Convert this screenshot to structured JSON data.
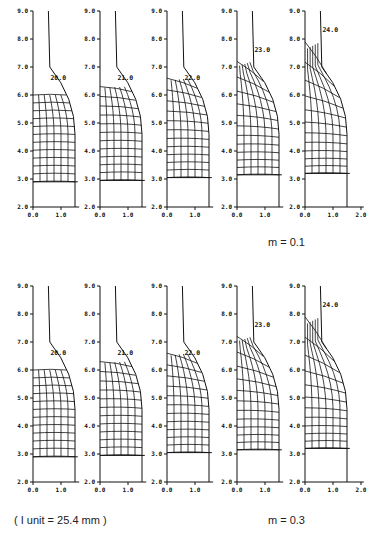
{
  "figure": {
    "captions": {
      "row1_param": "m = 0.1",
      "row2_param": "m = 0.3",
      "unit_note": "( I unit = 25.4 mm )"
    }
  },
  "chart_data": [
    {
      "type": "line",
      "title": "Deformed mesh evolution, m = 0.1",
      "xlabel": "",
      "ylabel": "",
      "xlim": [
        0.0,
        2.0
      ],
      "ylim": [
        2.0,
        9.0
      ],
      "y_ticks": [
        "2.0",
        "3.0",
        "4.0",
        "5.0",
        "6.0",
        "7.0",
        "8.0",
        "9.0"
      ],
      "x_ticks_panels_1_4": [
        "0.0",
        "1.0"
      ],
      "x_ticks_panel_5": [
        "0.0",
        "1.0",
        "2.0"
      ],
      "panels": [
        {
          "stage_label": "20.0",
          "mesh_top": 6.0,
          "mesh_bottom": 2.9,
          "die_x": 1.5
        },
        {
          "stage_label": "21.0",
          "mesh_top": 6.3,
          "mesh_bottom": 2.95,
          "die_x": 1.5
        },
        {
          "stage_label": "22.0",
          "mesh_top": 6.6,
          "mesh_bottom": 3.05,
          "die_x": 1.5
        },
        {
          "stage_label": "23.0",
          "mesh_top": 7.2,
          "mesh_bottom": 3.15,
          "die_x": 1.5
        },
        {
          "stage_label": "24.0",
          "mesh_top": 7.9,
          "mesh_bottom": 3.2,
          "die_x": 1.5
        }
      ]
    },
    {
      "type": "line",
      "title": "Deformed mesh evolution, m = 0.3",
      "xlabel": "",
      "ylabel": "",
      "xlim": [
        0.0,
        2.0
      ],
      "ylim": [
        2.0,
        9.0
      ],
      "y_ticks": [
        "2.0",
        "3.0",
        "4.0",
        "5.0",
        "6.0",
        "7.0",
        "8.0",
        "9.0"
      ],
      "x_ticks_panels_1_4": [
        "0.0",
        "1.0"
      ],
      "x_ticks_panel_5": [
        "0.0",
        "1.0",
        "2.0"
      ],
      "panels": [
        {
          "stage_label": "20.0",
          "mesh_top": 6.0,
          "mesh_bottom": 2.9,
          "die_x": 1.5
        },
        {
          "stage_label": "21.0",
          "mesh_top": 6.3,
          "mesh_bottom": 2.95,
          "die_x": 1.5
        },
        {
          "stage_label": "22.0",
          "mesh_top": 6.6,
          "mesh_bottom": 3.05,
          "die_x": 1.5
        },
        {
          "stage_label": "23.0",
          "mesh_top": 7.2,
          "mesh_bottom": 3.15,
          "die_x": 1.5
        },
        {
          "stage_label": "24.0",
          "mesh_top": 7.9,
          "mesh_bottom": 3.2,
          "die_x": 1.5
        }
      ]
    }
  ]
}
